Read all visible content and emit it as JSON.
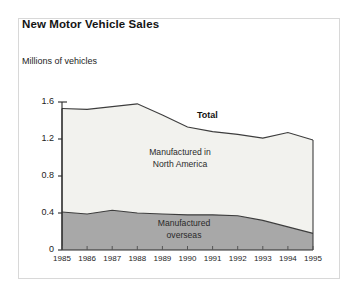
{
  "figure": {
    "title": "New Motor Vehicle Sales",
    "unit_label": "Millions of vehicles"
  },
  "annotations": {
    "total": "Total",
    "north_america_line1": "Manufactured in",
    "north_america_line2": "North America",
    "overseas_line1": "Manufactured",
    "overseas_line2": "overseas"
  },
  "colors": {
    "frame_border": "#d8d8d8",
    "line": "#3d3d3d",
    "overseas_fill": "#a8a8a8",
    "north_america_fill": "#f2f2ee",
    "axis": "#2b2b2b",
    "text": "#1d1d1d"
  },
  "chart_data": {
    "type": "area",
    "title": "New Motor Vehicle Sales",
    "subtitle": "",
    "xlabel": "",
    "ylabel": "Millions of vehicles",
    "stacked": true,
    "grid": false,
    "legend_position": "inline-annotations",
    "categories": [
      "1985",
      "1986",
      "1987",
      "1988",
      "1989",
      "1990",
      "1991",
      "1992",
      "1993",
      "1994",
      "1995"
    ],
    "x": [
      1985,
      1986,
      1987,
      1988,
      1989,
      1990,
      1991,
      1992,
      1993,
      1994,
      1995
    ],
    "xlim": [
      1985,
      1995
    ],
    "ylim": [
      0,
      1.6
    ],
    "ytick_labels": [
      "0",
      "0.4",
      "0.8",
      "1.2",
      "1.6"
    ],
    "yticks": [
      0,
      0.4,
      0.8,
      1.2,
      1.6
    ],
    "xtick_labels": [
      "1985",
      "1986",
      "1987",
      "1988",
      "1989",
      "1990",
      "1991",
      "1992",
      "1993",
      "1994",
      "1995"
    ],
    "series": [
      {
        "name": "Manufactured overseas",
        "stack_order": 1,
        "fill": "#a8a8a8",
        "values": [
          0.41,
          0.39,
          0.43,
          0.4,
          0.39,
          0.38,
          0.38,
          0.37,
          0.32,
          0.25,
          0.18
        ]
      },
      {
        "name": "Manufactured in North America",
        "stack_order": 2,
        "fill": "#f2f2ee",
        "values": [
          1.12,
          1.13,
          1.12,
          1.18,
          1.07,
          0.95,
          0.9,
          0.88,
          0.89,
          1.02,
          1.01
        ]
      }
    ],
    "total": {
      "name": "Total",
      "values": [
        1.53,
        1.52,
        1.55,
        1.58,
        1.46,
        1.33,
        1.28,
        1.25,
        1.21,
        1.27,
        1.19
      ]
    }
  }
}
